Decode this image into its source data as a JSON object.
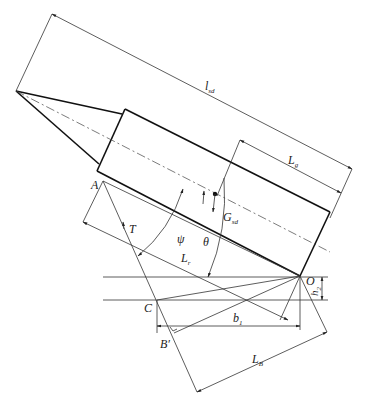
{
  "diagram": {
    "title": "",
    "colors": {
      "line": "#333333",
      "outline": "#111111",
      "background": "#ffffff"
    },
    "labels": {
      "overall_length": {
        "main": "l",
        "sub": "sd"
      },
      "section_length": {
        "main": "L",
        "sub": "g"
      },
      "gravity": {
        "main": "G",
        "sub": "sd"
      },
      "point_A": "A",
      "point_T": "T",
      "angle_psi": "ψ",
      "angle_theta": "θ",
      "length_Lt": {
        "main": "L",
        "sub": "r"
      },
      "point_O": "O",
      "height_h": {
        "main": "h",
        "sub": "2"
      },
      "point_C": "C",
      "width_b": {
        "main": "b",
        "sub": "1"
      },
      "point_B": "B′",
      "length_LB": {
        "main": "L",
        "sub": "B"
      }
    }
  }
}
